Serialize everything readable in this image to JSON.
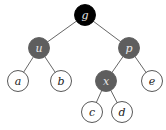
{
  "diagram": {
    "type": "binary-tree",
    "colors": {
      "black": "#000000",
      "gray": "#5e5e5e",
      "white": "#ffffff",
      "stroke": "#444444",
      "edge": "#555555"
    },
    "nodes": [
      {
        "id": "g",
        "label": "g",
        "x": 85,
        "y": 15,
        "fill": "black"
      },
      {
        "id": "u",
        "label": "u",
        "x": 39,
        "y": 48,
        "fill": "gray"
      },
      {
        "id": "p",
        "label": "p",
        "x": 129,
        "y": 48,
        "fill": "gray"
      },
      {
        "id": "a",
        "label": "a",
        "x": 18,
        "y": 81,
        "fill": "white"
      },
      {
        "id": "b",
        "label": "b",
        "x": 61,
        "y": 81,
        "fill": "white"
      },
      {
        "id": "x",
        "label": "x",
        "x": 106,
        "y": 81,
        "fill": "gray"
      },
      {
        "id": "e",
        "label": "e",
        "x": 152,
        "y": 81,
        "fill": "white"
      },
      {
        "id": "c",
        "label": "c",
        "x": 92,
        "y": 112,
        "fill": "white"
      },
      {
        "id": "d",
        "label": "d",
        "x": 122,
        "y": 112,
        "fill": "white"
      }
    ],
    "edges": [
      [
        "g",
        "u"
      ],
      [
        "g",
        "p"
      ],
      [
        "u",
        "a"
      ],
      [
        "u",
        "b"
      ],
      [
        "p",
        "x"
      ],
      [
        "p",
        "e"
      ],
      [
        "x",
        "c"
      ],
      [
        "x",
        "d"
      ]
    ],
    "radius": 10.5
  }
}
